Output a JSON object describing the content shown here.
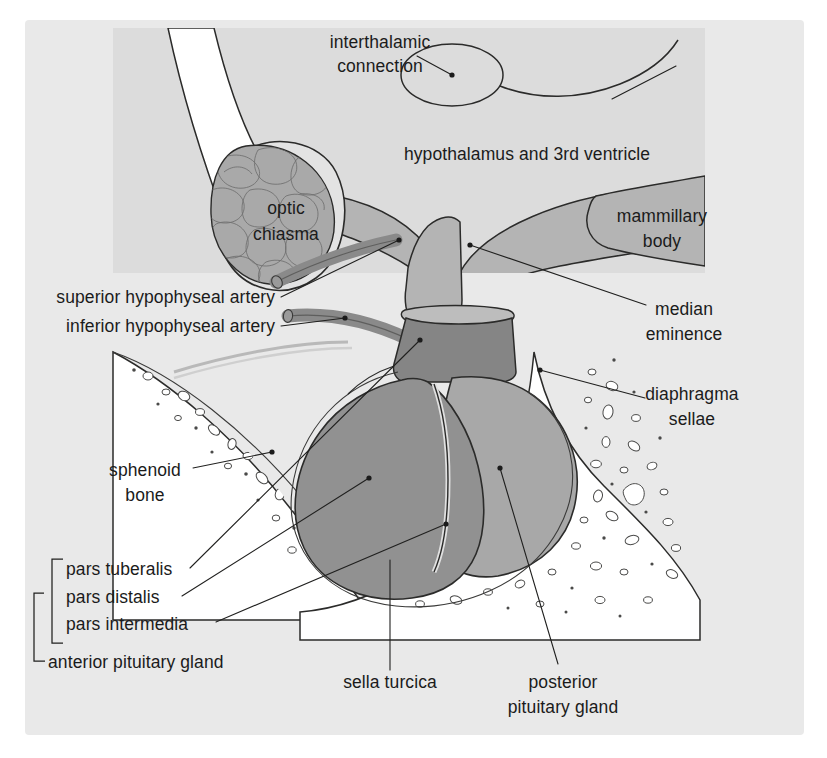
{
  "figure": {
    "canvas": {
      "width": 827,
      "height": 758
    },
    "colors": {
      "page_background": "#ffffff",
      "field_background": "#e9e9e9",
      "hypothalamus_panel": "#dcdcdc",
      "hypothalamus_tissue": "#b4b4b4",
      "optic_chiasma": "#a9a9a9",
      "anterior_pituitary": "#919191",
      "posterior_pituitary": "#a8a8a8",
      "infundibulum_stalk": "#858585",
      "artery": "#8a8a8a",
      "bone": "#ffffff",
      "outline": "#2b2b2a",
      "text": "#1b1b1b"
    }
  },
  "labels": [
    {
      "id": "interthalamic-connection",
      "lines": [
        "interthalamic",
        "connection"
      ],
      "x": 380,
      "y": 48,
      "anchor": "mid"
    },
    {
      "id": "hypothalamus-third-ventricle",
      "lines": [
        "hypothalamus and 3rd ventricle"
      ],
      "x": 527,
      "y": 160,
      "anchor": "mid"
    },
    {
      "id": "optic-chiasma",
      "lines": [
        "optic",
        "chiasma"
      ],
      "x": 286,
      "y": 214,
      "anchor": "mid"
    },
    {
      "id": "mammillary-body",
      "lines": [
        "mammillary",
        "body"
      ],
      "x": 662,
      "y": 222,
      "anchor": "mid"
    },
    {
      "id": "superior-hypophyseal-artery",
      "lines": [
        "superior hypophyseal artery"
      ],
      "x": 275,
      "y": 303,
      "anchor": "end"
    },
    {
      "id": "inferior-hypophyseal-artery",
      "lines": [
        "inferior hypophyseal artery"
      ],
      "x": 275,
      "y": 332,
      "anchor": "end"
    },
    {
      "id": "median-eminence",
      "lines": [
        "median",
        "eminence"
      ],
      "x": 684,
      "y": 315,
      "anchor": "mid"
    },
    {
      "id": "diaphragma-sellae",
      "lines": [
        "diaphragma",
        "sellae"
      ],
      "x": 687,
      "y": 400,
      "anchor": "mid"
    },
    {
      "id": "sphenoid-bone",
      "lines": [
        "sphenoid",
        "bone"
      ],
      "x": 145,
      "y": 476,
      "anchor": "mid"
    },
    {
      "id": "pars-tuberalis",
      "lines": [
        "pars tuberalis"
      ],
      "x": 58,
      "y": 575,
      "anchor": "start"
    },
    {
      "id": "pars-distalis",
      "lines": [
        "pars distalis"
      ],
      "x": 58,
      "y": 602,
      "anchor": "start"
    },
    {
      "id": "pars-intermedia",
      "lines": [
        "pars intermedia"
      ],
      "x": 58,
      "y": 629,
      "anchor": "start"
    },
    {
      "id": "anterior-pituitary-gland",
      "lines": [
        "anterior pituitary gland"
      ],
      "x": 50,
      "y": 668,
      "anchor": "start"
    },
    {
      "id": "sella-turcica",
      "lines": [
        "sella turcica"
      ],
      "x": 390,
      "y": 688,
      "anchor": "mid"
    },
    {
      "id": "posterior-pituitary-gland",
      "lines": [
        "posterior",
        "pituitary gland"
      ],
      "x": 563,
      "y": 688,
      "anchor": "mid"
    }
  ],
  "text": {
    "interthalamic_connection_l1": "interthalamic",
    "interthalamic_connection_l2": "connection",
    "hypothalamus": "hypothalamus and 3rd ventricle",
    "optic_chiasma_l1": "optic",
    "optic_chiasma_l2": "chiasma",
    "mammillary_body_l1": "mammillary",
    "mammillary_body_l2": "body",
    "superior_hypophyseal_artery": "superior hypophyseal artery",
    "inferior_hypophyseal_artery": "inferior hypophyseal artery",
    "median_eminence_l1": "median",
    "median_eminence_l2": "eminence",
    "diaphragma_sellae_l1": "diaphragma",
    "diaphragma_sellae_l2": "sellae",
    "sphenoid_bone_l1": "sphenoid",
    "sphenoid_bone_l2": "bone",
    "pars_tuberalis": "pars tuberalis",
    "pars_distalis": "pars distalis",
    "pars_intermedia": "pars intermedia",
    "anterior_pituitary_gland": "anterior pituitary gland",
    "sella_turcica": "sella turcica",
    "posterior_pituitary_l1": "posterior",
    "posterior_pituitary_l2": "pituitary gland"
  }
}
